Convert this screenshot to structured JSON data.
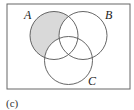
{
  "diagram": {
    "type": "venn",
    "caption": "(c)",
    "sets": [
      {
        "id": "A",
        "label": "A"
      },
      {
        "id": "B",
        "label": "B"
      },
      {
        "id": "C",
        "label": "C"
      }
    ],
    "shaded_region": "A only (A ∩ B' ∩ C')",
    "colors": {
      "shade": "#d9d9d9",
      "stroke": "#555555",
      "frame": "#666666"
    }
  }
}
